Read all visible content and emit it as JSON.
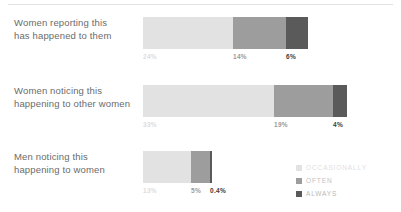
{
  "chart_data": {
    "type": "bar",
    "orientation": "horizontal",
    "stacked": true,
    "title": "",
    "xlabel": "",
    "ylabel": "",
    "categories": [
      "Women reporting this has happened to them",
      "Women noticing this happening to other women",
      "Men noticing this happening to women"
    ],
    "series": [
      {
        "name": "OCCASIONALLY",
        "color": "#e2e2e2",
        "values": [
          24,
          33,
          13
        ],
        "value_labels": [
          "24%",
          "33%",
          "13%"
        ]
      },
      {
        "name": "OFTEN",
        "color": "#9d9d9d",
        "values": [
          14,
          19,
          5
        ],
        "value_labels": [
          "14%",
          "19%",
          "5%"
        ]
      },
      {
        "name": "ALWAYS",
        "color": "#5a5a5a",
        "values": [
          6,
          4,
          0.4
        ],
        "value_labels": [
          "6%",
          "4%",
          "0.4%"
        ]
      }
    ],
    "legend_position": "bottom-right",
    "grid": false
  },
  "rows": [
    {
      "label_line1": "Women reporting this",
      "label_line2": "has happened to them",
      "segments": [
        {
          "series": "OCCASIONALLY",
          "value_label": "24%",
          "width_px": 90
        },
        {
          "series": "OFTEN",
          "value_label": "14%",
          "width_px": 53
        },
        {
          "series": "ALWAYS",
          "value_label": "6%",
          "width_px": 22
        }
      ]
    },
    {
      "label_line1": "Women noticing this",
      "label_line2": "happening to other women",
      "segments": [
        {
          "series": "OCCASIONALLY",
          "value_label": "33%",
          "width_px": 131
        },
        {
          "series": "OFTEN",
          "value_label": "19%",
          "width_px": 59
        },
        {
          "series": "ALWAYS",
          "value_label": "4%",
          "width_px": 14
        }
      ]
    },
    {
      "label_line1": "Men noticing this",
      "label_line2": "happening to women",
      "segments": [
        {
          "series": "OCCASIONALLY",
          "value_label": "13%",
          "width_px": 48
        },
        {
          "series": "OFTEN",
          "value_label": "5%",
          "width_px": 19
        },
        {
          "series": "ALWAYS",
          "value_label": "0.4%",
          "width_px": 2
        }
      ]
    }
  ],
  "legend": {
    "items": [
      {
        "label": "OCCASIONALLY",
        "color": "#e2e2e2"
      },
      {
        "label": "OFTEN",
        "color": "#9d9d9d"
      },
      {
        "label": "ALWAYS",
        "color": "#5a5a5a"
      }
    ]
  }
}
